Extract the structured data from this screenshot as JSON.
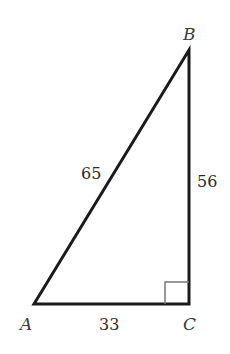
{
  "diagram": {
    "type": "right-triangle",
    "vertices": [
      {
        "id": "A",
        "label": "A"
      },
      {
        "id": "B",
        "label": "B"
      },
      {
        "id": "C",
        "label": "C"
      }
    ],
    "sides": {
      "AB": "65",
      "BC": "56",
      "AC": "33"
    },
    "right_angle_at": "C",
    "colors": {
      "stroke": "#1a1a1a",
      "right_angle_marker": "#777777"
    }
  }
}
